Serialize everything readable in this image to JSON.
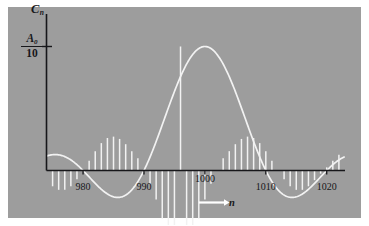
{
  "figure": {
    "background_color": "#9d9d9d",
    "border_color": "#ffffff",
    "ink_color": "#17171a",
    "stem_color": "#f2f2f2"
  },
  "axes": {
    "y_axis_label": "C",
    "y_axis_label_sub": "n",
    "y_tick_numerator": "A",
    "y_tick_numerator_sub": "0",
    "y_tick_denominator": "10",
    "x_axis_label": "n",
    "x_axis_arrow": "arrow-right-icon"
  },
  "chart_data": {
    "type": "bar",
    "title": "",
    "subtitle": "",
    "xlabel": "n",
    "ylabel": "C_n",
    "grid": false,
    "legend": null,
    "xlim": [
      974,
      1023
    ],
    "ylim": [
      -0.035,
      0.115
    ],
    "xticks": [
      980,
      990,
      1000,
      1010,
      1020
    ],
    "xticklabels": [
      "980",
      "990",
      "1000",
      "1010",
      "1020"
    ],
    "yticks": [
      0.1
    ],
    "yticklabels": [
      "A_0/10"
    ],
    "envelope": {
      "function": "sinc",
      "center": 1000,
      "peak": 0.1,
      "first_zero_offset": 10,
      "description": "A0/10 * sin(pi*(n-1000)/10) / (pi*(n-1000)/10)"
    },
    "categories": [
      975,
      976,
      977,
      978,
      979,
      980,
      981,
      982,
      983,
      984,
      985,
      986,
      987,
      988,
      989,
      990,
      991,
      992,
      993,
      994,
      995,
      996,
      997,
      998,
      999,
      1000,
      1001,
      1002,
      1003,
      1004,
      1005,
      1006,
      1007,
      1008,
      1009,
      1010,
      1011,
      1012,
      1013,
      1014,
      1015,
      1016,
      1017,
      1018,
      1019,
      1020,
      1021,
      1022
    ],
    "values": [
      -0.01273,
      -0.01559,
      -0.0156,
      -0.01263,
      -0.00701,
      0.0,
      0.00779,
      0.0156,
      0.0221,
      0.02621,
      0.02732,
      0.02546,
      0.02122,
      0.0156,
      0.00982,
      0.0,
      -0.01061,
      -0.02339,
      -0.03899,
      -0.05784,
      -0.07958,
      0.1,
      -0.07958,
      -0.05784,
      -0.03899,
      -0.02339,
      -0.01061,
      0.0,
      0.00982,
      0.0156,
      0.02122,
      0.02546,
      0.02732,
      0.02621,
      0.0221,
      0.0156,
      0.00779,
      0.0,
      -0.00701,
      -0.01263,
      -0.0156,
      -0.01559,
      -0.01273,
      -0.00779,
      -0.00255,
      0.00255,
      0.00779,
      0.01273
    ]
  }
}
